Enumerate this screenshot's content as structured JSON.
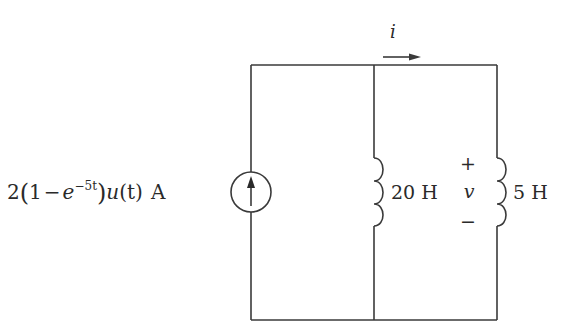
{
  "diagram": {
    "type": "circuit",
    "source": {
      "kind": "current-source",
      "direction": "up",
      "label_parts": {
        "coef": "2",
        "open": "(",
        "one": "1",
        "minus": "−",
        "e": "e",
        "exp": "−5t",
        "close": ")",
        "u": "u",
        "paren_t": "(t)",
        "unit": "A"
      }
    },
    "current_label": "i",
    "inductor_1": {
      "value": "20 H"
    },
    "inductor_2": {
      "value": "5 H"
    },
    "voltage": {
      "label": "v",
      "plus": "+",
      "minus": "−"
    }
  }
}
